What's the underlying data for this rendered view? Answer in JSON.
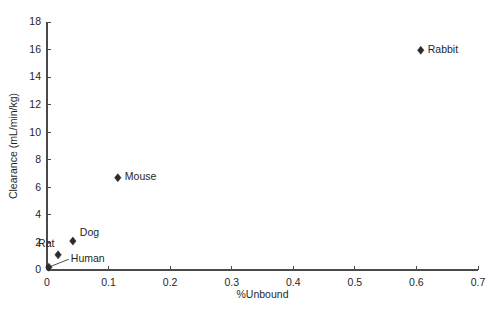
{
  "chart_data": {
    "type": "scatter",
    "title": "",
    "xlabel": "%Unbound",
    "ylabel": "Clearance (mL/min/kg)",
    "xlim": [
      0,
      0.7
    ],
    "ylim": [
      0,
      18
    ],
    "xticks": [
      "0",
      "0.1",
      "0.2",
      "0.3",
      "0.4",
      "0.5",
      "0.6",
      "0.7"
    ],
    "xtick_values": [
      0,
      0.1,
      0.2,
      0.3,
      0.4,
      0.5,
      0.6,
      0.7
    ],
    "yticks": [
      "0",
      "2",
      "4",
      "6",
      "8",
      "10",
      "12",
      "14",
      "16",
      "18"
    ],
    "ytick_values": [
      0,
      2,
      4,
      6,
      8,
      10,
      12,
      14,
      16,
      18
    ],
    "grid": false,
    "legend": "none",
    "marker": "diamond",
    "marker_color": "#2b2b2b",
    "points": [
      {
        "label": "Human",
        "x": 0.003,
        "y": 0.2,
        "label_dx": 22,
        "label_dy": -8,
        "leader": true
      },
      {
        "label": "Rat",
        "x": 0.018,
        "y": 1.1,
        "label_dx": -20,
        "label_dy": -11,
        "leader": false
      },
      {
        "label": "Dog",
        "x": 0.042,
        "y": 2.1,
        "label_dx": 7,
        "label_dy": -8,
        "leader": false
      },
      {
        "label": "Mouse",
        "x": 0.115,
        "y": 6.7,
        "label_dx": 7,
        "label_dy": 0,
        "leader": false
      },
      {
        "label": "Rabbit",
        "x": 0.607,
        "y": 15.95,
        "label_dx": 7,
        "label_dy": 0,
        "leader": false
      }
    ]
  }
}
